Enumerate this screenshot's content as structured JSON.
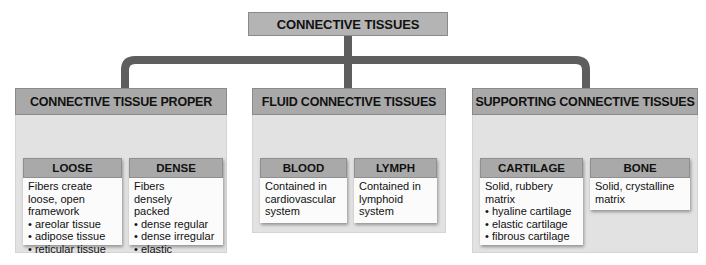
{
  "title": "CONNECTIVE TISSUES",
  "colors": {
    "connector": "#5e5e5e",
    "header_fill": "#a9a9a9",
    "panel_fill": "#e2e2e2",
    "box_fill": "#fbfbfb"
  },
  "categories": [
    {
      "label": "CONNECTIVE TISSUE PROPER",
      "types": [
        {
          "label": "LOOSE",
          "description": "Fibers create loose, open framework",
          "examples": [
            "areolar tissue",
            "adipose tissue",
            "reticular tissue"
          ]
        },
        {
          "label": "DENSE",
          "description": "Fibers densely packed",
          "examples": [
            "dense regular",
            "dense irregular",
            "elastic"
          ]
        }
      ]
    },
    {
      "label": "FLUID CONNECTIVE TISSUES",
      "types": [
        {
          "label": "BLOOD",
          "description": "Contained in cardiovascular system",
          "examples": []
        },
        {
          "label": "LYMPH",
          "description": "Contained in lymphoid system",
          "examples": []
        }
      ]
    },
    {
      "label": "SUPPORTING CONNECTIVE TISSUES",
      "types": [
        {
          "label": "CARTILAGE",
          "description": "Solid, rubbery matrix",
          "examples": [
            "hyaline cartilage",
            "elastic cartilage",
            "fibrous cartilage"
          ]
        },
        {
          "label": "BONE",
          "description": "Solid, crystalline matrix",
          "examples": []
        }
      ]
    }
  ]
}
